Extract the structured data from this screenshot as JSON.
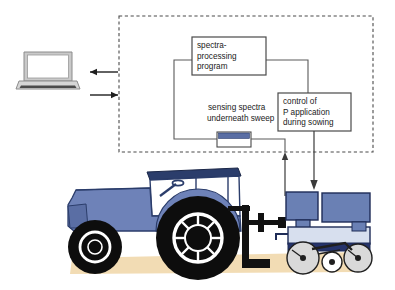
{
  "figure": {
    "background_color": "#ffffff"
  },
  "colors": {
    "tractor_body": "#6e82b8",
    "tractor_roof": "#2b3d6b",
    "tractor_shadow": "#5a6ea4",
    "wheel": "#0d0d0d",
    "hub": "#ffffff",
    "seeder_hopper": "#6a80b4",
    "seeder_frame": "#d7dfee",
    "seeder_dark": "#25336b",
    "press_wheel": "#d9d9d9",
    "soil": "#f2dcb4",
    "line": "#3a3a3a",
    "dashed_border": "#4a4a4a",
    "laptop_case": "#b8b8b8",
    "laptop_screen": "#ffffff",
    "hitch": "#111111",
    "sensor_bar": "#5a6ea4"
  },
  "dashed_region": {
    "name": "on-board system boundary",
    "style": "dashed"
  },
  "boxes": [
    {
      "id": "spectra-processing",
      "lines": [
        "spectra-",
        "processing",
        "program"
      ]
    },
    {
      "id": "control-p-application",
      "lines": [
        "control of",
        "P application",
        "during sowing"
      ]
    }
  ],
  "labels": [
    {
      "id": "sensing-spectra",
      "lines": [
        "sensing spectra",
        "underneath sweep"
      ]
    }
  ],
  "arrows": [
    {
      "id": "to-laptop",
      "direction": "left",
      "label": ""
    },
    {
      "id": "from-laptop",
      "direction": "right",
      "label": ""
    },
    {
      "id": "sensor-feedback-up",
      "direction": "up",
      "label": ""
    },
    {
      "id": "control-to-seeder-down",
      "direction": "down",
      "label": ""
    }
  ],
  "machinery": {
    "tractor": "tractor",
    "seeder": "seeder with fertiliser hoppers",
    "sensor": "soil spectra sensor under sweep",
    "laptop": "laptop computer",
    "soil": "soil surface"
  }
}
